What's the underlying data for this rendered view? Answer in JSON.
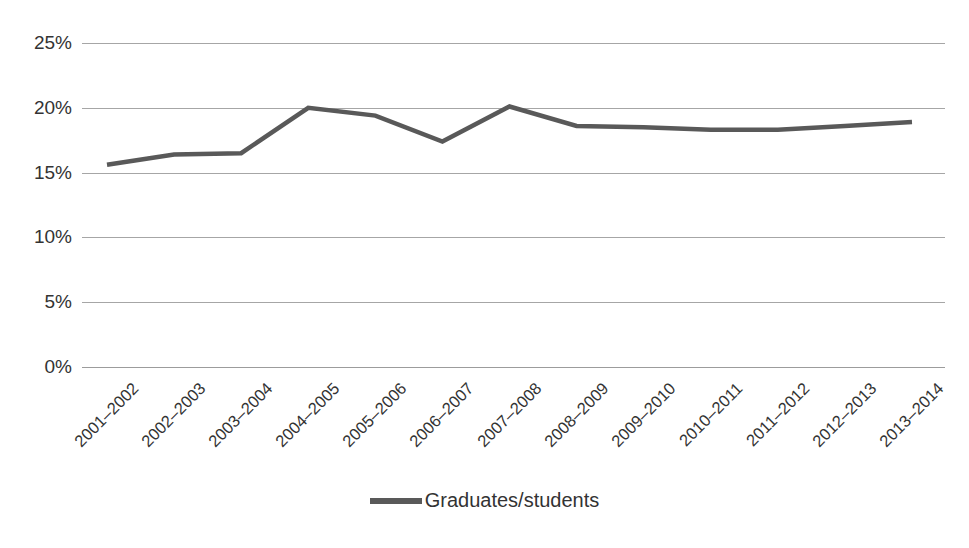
{
  "chart_data": {
    "type": "line",
    "title": "",
    "xlabel": "",
    "ylabel": "",
    "categories": [
      "2001–2002",
      "2002–2003",
      "2003–2004",
      "2004–2005",
      "2005–2006",
      "2006–2007",
      "2007–2008",
      "2008–2009",
      "2009–2010",
      "2010–2011",
      "2011–2012",
      "2012–2013",
      "2013–2014"
    ],
    "series": [
      {
        "name": "Graduates/students",
        "color": "#595959",
        "values": [
          15.6,
          16.4,
          16.5,
          20.0,
          19.4,
          17.4,
          20.1,
          18.6,
          18.5,
          18.3,
          18.3,
          18.6,
          18.9
        ]
      }
    ],
    "ylim": [
      0,
      25
    ],
    "ytick_values": [
      0,
      5,
      10,
      15,
      20,
      25
    ],
    "ytick_labels": [
      "0%",
      "5%",
      "10%",
      "15%",
      "20%",
      "25%"
    ],
    "grid": true,
    "grid_color": "#a6a6a6",
    "legend_position": "bottom",
    "legend_entries": [
      "Graduates/students"
    ],
    "xlabel_rotation": -45,
    "background_color": "#ffffff"
  }
}
